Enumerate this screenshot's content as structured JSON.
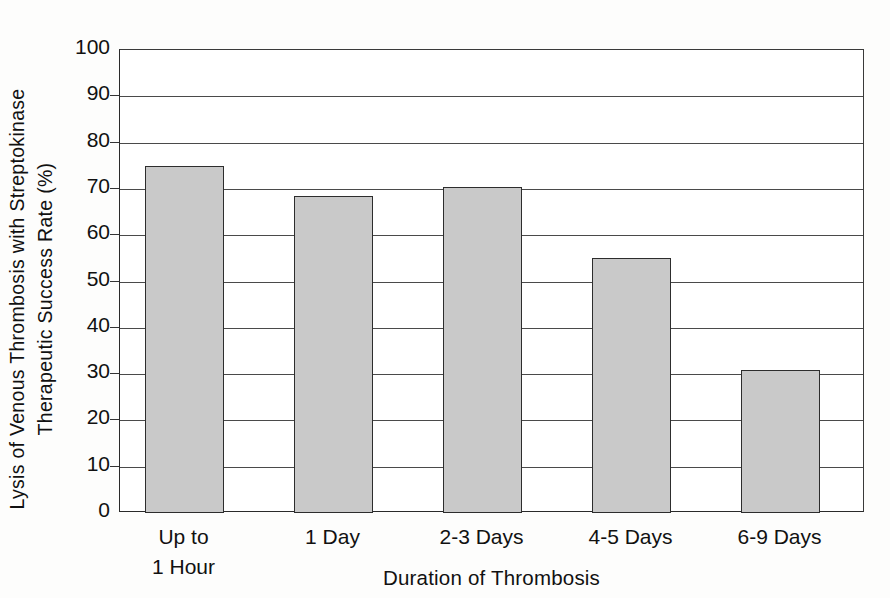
{
  "chart_data": {
    "type": "bar",
    "title": "",
    "categories": [
      "Up to 1 Hour",
      "1 Day",
      "2-3 Days",
      "4-5 Days",
      "6-9 Days"
    ],
    "category_lines": [
      [
        "Up to",
        "1 Hour"
      ],
      [
        "1 Day"
      ],
      [
        "2-3 Days"
      ],
      [
        "4-5 Days"
      ],
      [
        "6-9 Days"
      ]
    ],
    "values": [
      75,
      68.5,
      70.5,
      55,
      31
    ],
    "xlabel": "Duration of Thrombosis",
    "ylabel": "Lysis of Venous Thrombosis with Streptokinase Therapeutic Success Rate (%)",
    "ylabel_line1": "Lysis of Venous Thrombosis with Streptokinase",
    "ylabel_line2": "Therapeutic Success Rate (%)",
    "ylim": [
      0,
      100
    ],
    "ytick_labels": [
      "100",
      "90",
      "80",
      "70",
      "60",
      "50",
      "40",
      "30",
      "20",
      "10",
      "0"
    ],
    "ytick_values": [
      100,
      90,
      80,
      70,
      60,
      50,
      40,
      30,
      20,
      10,
      0
    ],
    "grid": true,
    "legend": false,
    "bar_fill_color": "#c9c9c9",
    "bar_edge_color": "#2d2d2d",
    "gridline_color": "#4a4a4a",
    "axis_color": "#2a2a2a",
    "background_color": "#fdfdfc"
  }
}
